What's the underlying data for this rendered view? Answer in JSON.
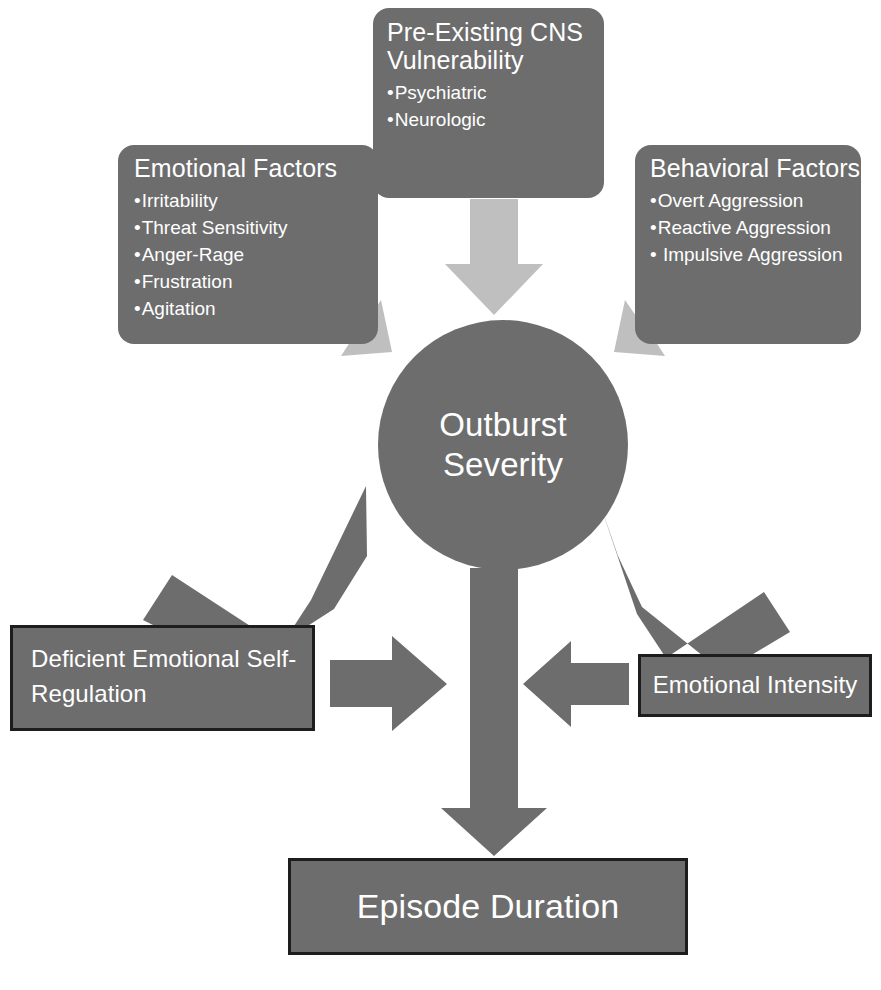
{
  "diagram": {
    "colors": {
      "node_fill": "#6d6d6d",
      "node_border": "#1d1d1d",
      "arrow_light": "#bfbfbf",
      "arrow_dark": "#6d6d6d",
      "text": "#ffffff",
      "background": "#ffffff"
    }
  },
  "nodes": {
    "cns": {
      "title": "Pre-Existing CNS\nVulnerability",
      "bullets": [
        "Psychiatric",
        "Neurologic"
      ]
    },
    "emotional_factors": {
      "title": "Emotional Factors",
      "bullets": [
        "Irritability",
        "Threat Sensitivity",
        "Anger-Rage",
        "Frustration",
        "Agitation"
      ]
    },
    "behavioral_factors": {
      "title": "Behavioral Factors",
      "bullets": [
        "Overt Aggression",
        "Reactive Aggression",
        " Impulsive Aggression"
      ]
    },
    "outburst": {
      "title": "Outburst\nSeverity"
    },
    "deficient_emotional_self_regulation": {
      "title": "Deficient Emotional Self-\nRegulation"
    },
    "emotional_intensity": {
      "title": "Emotional Intensity"
    },
    "episode_duration": {
      "title": "Episode Duration"
    }
  },
  "arrows": [
    {
      "id": "cns-to-outburst",
      "from": "cns",
      "to": "outburst",
      "style": "light",
      "direction": "down"
    },
    {
      "id": "emotional-factors-to-outburst",
      "from": "emotional_factors",
      "to": "outburst",
      "style": "light",
      "direction": "down-right"
    },
    {
      "id": "behavioral-factors-to-outburst",
      "from": "behavioral_factors",
      "to": "outburst",
      "style": "light",
      "direction": "down-left"
    },
    {
      "id": "desr-to-outburst",
      "from": "deficient_emotional_self_regulation",
      "to": "outburst",
      "style": "dark",
      "direction": "up-right"
    },
    {
      "id": "intensity-to-outburst",
      "from": "emotional_intensity",
      "to": "outburst",
      "style": "dark",
      "direction": "up-left"
    },
    {
      "id": "desr-to-center",
      "from": "deficient_emotional_self_regulation",
      "to": "episode_duration",
      "style": "dark",
      "direction": "right"
    },
    {
      "id": "intensity-to-center",
      "from": "emotional_intensity",
      "to": "episode_duration",
      "style": "dark",
      "direction": "left"
    },
    {
      "id": "outburst-to-episode-duration",
      "from": "outburst",
      "to": "episode_duration",
      "style": "dark",
      "direction": "down"
    }
  ]
}
